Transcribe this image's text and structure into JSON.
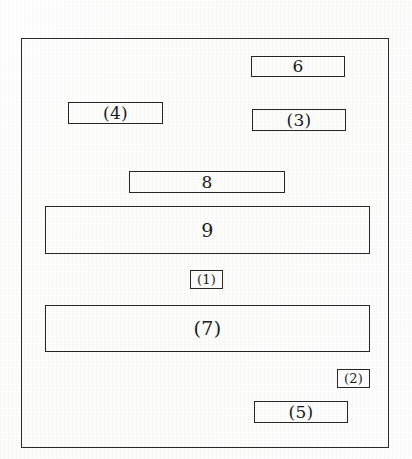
{
  "figure": {
    "type": "patent-block-diagram",
    "background_color": "#fdfdfd",
    "line_color": "#262626",
    "frame": {
      "name": "outer-frame",
      "x": 21,
      "y": 38,
      "width": 368,
      "height": 410
    },
    "blocks": [
      {
        "id": "6",
        "label": "6",
        "x": 251,
        "y": 56,
        "width": 94,
        "height": 21,
        "size": "lg"
      },
      {
        "id": "4",
        "label": "(4)",
        "x": 68,
        "y": 102,
        "width": 95,
        "height": 22,
        "size": "lg"
      },
      {
        "id": "3",
        "label": "(3)",
        "x": 252,
        "y": 109,
        "width": 94,
        "height": 22,
        "size": "lg"
      },
      {
        "id": "8",
        "label": "8",
        "x": 129,
        "y": 171,
        "width": 156,
        "height": 22,
        "size": "lg"
      },
      {
        "id": "9",
        "label": "9",
        "x": 45,
        "y": 206,
        "width": 325,
        "height": 48,
        "size": "xl"
      },
      {
        "id": "1",
        "label": "(1)",
        "x": 190,
        "y": 270,
        "width": 33,
        "height": 19,
        "size": "sm"
      },
      {
        "id": "7",
        "label": "(7)",
        "x": 45,
        "y": 305,
        "width": 325,
        "height": 47,
        "size": "xl"
      },
      {
        "id": "2",
        "label": "(2)",
        "x": 337,
        "y": 369,
        "width": 33,
        "height": 19,
        "size": "sm"
      },
      {
        "id": "5",
        "label": "(5)",
        "x": 254,
        "y": 401,
        "width": 94,
        "height": 22,
        "size": "lg"
      }
    ]
  }
}
